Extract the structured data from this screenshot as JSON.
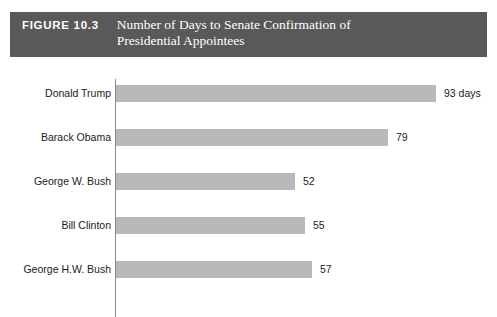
{
  "header": {
    "figure_number": "FIGURE 10.3",
    "title_line_1": "Number of Days to Senate Confirmation of",
    "title_line_2": "Presidential Appointees",
    "background_color": "#595959",
    "text_color": "#ffffff"
  },
  "chart_data": {
    "type": "bar",
    "orientation": "horizontal",
    "title": "Number of Days to Senate Confirmation of Presidential Appointees",
    "xlabel": "",
    "ylabel": "",
    "categories": [
      "Donald Trump",
      "Barack Obama",
      "George W. Bush",
      "Bill Clinton",
      "George H.W. Bush"
    ],
    "values": [
      93,
      79,
      52,
      55,
      57
    ],
    "value_labels": [
      "93 days",
      "79",
      "52",
      "55",
      "57"
    ],
    "unit": "days",
    "xlim": [
      0,
      93
    ],
    "grid": false,
    "legend": false,
    "bar_color": "#b9b9b9",
    "axis_color": "#8a8a8a"
  },
  "rows": [
    {
      "label": "Donald Trump",
      "value": 93,
      "value_label": "93 days"
    },
    {
      "label": "Barack Obama",
      "value": 79,
      "value_label": "79"
    },
    {
      "label": "George W. Bush",
      "value": 52,
      "value_label": "52"
    },
    {
      "label": "Bill Clinton",
      "value": 55,
      "value_label": "55"
    },
    {
      "label": "George H.W. Bush",
      "value": 57,
      "value_label": "57"
    }
  ]
}
